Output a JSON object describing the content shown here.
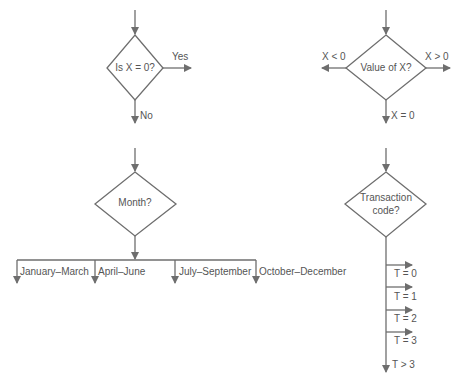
{
  "colors": {
    "line": "#6e6e6e",
    "text": "#555555",
    "background": "#ffffff"
  },
  "diagrams": [
    {
      "id": "is-x-zero",
      "decision": "Is X = 0?",
      "branches": [
        {
          "label": "Yes",
          "direction": "right"
        },
        {
          "label": "No",
          "direction": "down"
        }
      ]
    },
    {
      "id": "value-of-x",
      "decision": "Value of X?",
      "branches": [
        {
          "label": "X < 0",
          "direction": "left"
        },
        {
          "label": "X > 0",
          "direction": "right"
        },
        {
          "label": "X = 0",
          "direction": "down"
        }
      ]
    },
    {
      "id": "month",
      "decision": "Month?",
      "branches": [
        {
          "label": "January–March"
        },
        {
          "label": "April–June"
        },
        {
          "label": "July–September"
        },
        {
          "label": "October–December"
        }
      ]
    },
    {
      "id": "transaction-code",
      "decision_line1": "Transaction",
      "decision_line2": "code?",
      "branches": [
        {
          "label": "T = 0"
        },
        {
          "label": "T = 1"
        },
        {
          "label": "T = 2"
        },
        {
          "label": "T = 3"
        },
        {
          "label": "T > 3"
        }
      ]
    }
  ]
}
